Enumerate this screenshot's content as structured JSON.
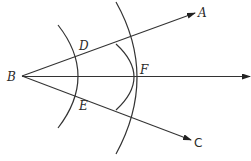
{
  "diagram": {
    "points": {
      "B": {
        "label": "B",
        "x": 22,
        "y": 76
      },
      "A": {
        "label": "A",
        "x": 195,
        "y": 13
      },
      "C": {
        "label": "C",
        "x": 191,
        "y": 140
      },
      "D": {
        "label": "D",
        "x": 80,
        "y": 55
      },
      "E": {
        "label": "E",
        "x": 80,
        "y": 97
      },
      "F": {
        "label": "F",
        "x": 137,
        "y": 77
      }
    },
    "rays": [
      {
        "from": "B",
        "to": "A",
        "arrow": true
      },
      {
        "from": "B",
        "to": "F",
        "arrow": true,
        "extends_to_x": 250
      },
      {
        "from": "B",
        "to": "C",
        "arrow": true
      }
    ],
    "arcs": [
      {
        "center": "B",
        "through": [
          "D",
          "E"
        ]
      },
      {
        "center": "D",
        "through": [
          "F"
        ]
      },
      {
        "center": "E",
        "through": [
          "F"
        ]
      }
    ],
    "colors": {
      "stroke": "#333333",
      "text": "#2a2a2a",
      "background": "#ffffff"
    }
  }
}
